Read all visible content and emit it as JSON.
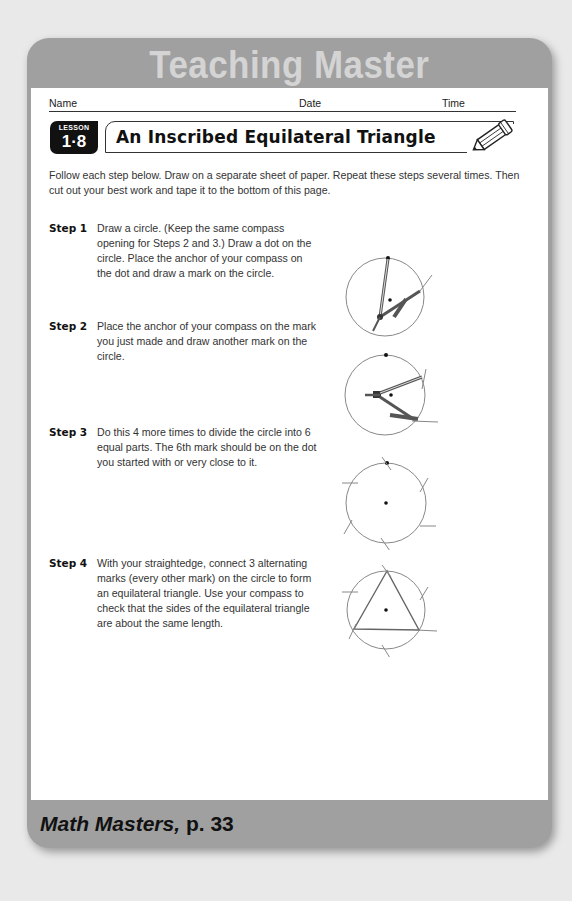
{
  "header": {
    "title": "Teaching Master"
  },
  "fields": {
    "name_label": "Name",
    "date_label": "Date",
    "time_label": "Time"
  },
  "lesson": {
    "badge_label": "LESSON",
    "number": "1·8",
    "title": "An Inscribed Equilateral Triangle",
    "icon": "pencil-icon"
  },
  "intro": "Follow each step below. Draw on a separate sheet of paper. Repeat these steps several times. Then cut out your best work and tape it to the bottom of this page.",
  "steps": [
    {
      "label": "Step 1",
      "text": "Draw a circle. (Keep the same compass opening for Steps 2 and 3.) Draw a dot on the circle. Place the anchor of your compass on the dot and draw a mark on the circle.",
      "figure": "circle-with-compass-at-top-dot"
    },
    {
      "label": "Step 2",
      "text": "Place the anchor of your compass on the mark you just made and draw another mark on the circle.",
      "figure": "circle-with-compass-at-right-mark"
    },
    {
      "label": "Step 3",
      "text": "Do this 4 more times to divide the circle into 6 equal parts. The 6th mark should be on the dot you started with or very close to it.",
      "figure": "circle-with-six-marks"
    },
    {
      "label": "Step 4",
      "text": "With your straightedge, connect 3 alternating marks (every other mark) on the circle to form an equilateral triangle. Use your compass to check that the sides of the equilateral triangle are about the same length.",
      "figure": "circle-with-inscribed-triangle"
    }
  ],
  "footer": {
    "book_title": "Math Masters,",
    "page_ref": " p. 33"
  },
  "colors": {
    "frame_gray": "#a0a0a0",
    "header_text": "#d4d4d4",
    "badge_black": "#111111",
    "background": "#e9e9e9"
  }
}
